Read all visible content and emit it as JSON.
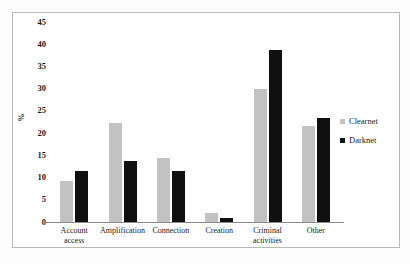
{
  "chart_data": {
    "type": "bar",
    "title": "",
    "xlabel": "",
    "ylabel": "%",
    "ylim": [
      0,
      45
    ],
    "ytick_step": 5,
    "yticks": [
      "45",
      "40",
      "35",
      "30",
      "25",
      "20",
      "15",
      "10",
      "5",
      "0"
    ],
    "grid": false,
    "legend_position": "right",
    "categories": [
      "Account access",
      "Amplification",
      "Connection",
      "Creation",
      "Criminal activities",
      "Other"
    ],
    "category_lines": [
      [
        "Account",
        "access"
      ],
      [
        "Amplification"
      ],
      [
        "Connection"
      ],
      [
        "Creation"
      ],
      [
        "Criminal",
        "activities"
      ],
      [
        "Other"
      ]
    ],
    "series": [
      {
        "name": "Clearnet",
        "color": "#c2c2c2",
        "values": [
          9.3,
          22.2,
          14.3,
          2.0,
          30.0,
          21.5
        ]
      },
      {
        "name": "Darknet",
        "color": "#101010",
        "values": [
          11.5,
          13.7,
          11.4,
          0.8,
          38.6,
          23.3
        ]
      }
    ]
  }
}
